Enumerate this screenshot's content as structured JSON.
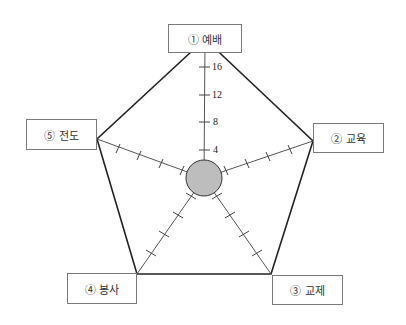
{
  "diagram": {
    "type": "radar-pentagon",
    "center": {
      "x": 204,
      "y": 178,
      "radius": 18,
      "fill": "#bdbdbd"
    },
    "axes": [
      {
        "id": "1",
        "label": "① 예배",
        "vertex": {
          "x": 205,
          "y": 39
        }
      },
      {
        "id": "2",
        "label": "② 교육",
        "vertex": {
          "x": 313,
          "y": 141
        }
      },
      {
        "id": "3",
        "label": "③ 교제",
        "vertex": {
          "x": 271,
          "y": 274
        }
      },
      {
        "id": "4",
        "label": "④ 봉사",
        "vertex": {
          "x": 137,
          "y": 274
        }
      },
      {
        "id": "5",
        "label": "⑤ 전도",
        "vertex": {
          "x": 97,
          "y": 139
        }
      }
    ],
    "scale": {
      "ticks": [
        "4",
        "8",
        "12",
        "16",
        "20"
      ],
      "max": 20
    }
  },
  "labels": {
    "axis1": "① 예배",
    "axis2": "② 교육",
    "axis3": "③ 교제",
    "axis4": "④ 봉사",
    "axis5": "⑤ 전도"
  },
  "ticks": {
    "t4": "4",
    "t8": "8",
    "t12": "12",
    "t16": "16",
    "t20": "20"
  },
  "colors": {
    "line": "#222222",
    "axis": "#555555",
    "circle_fill": "#bdbdbd",
    "box_border": "#7a7a7a"
  }
}
